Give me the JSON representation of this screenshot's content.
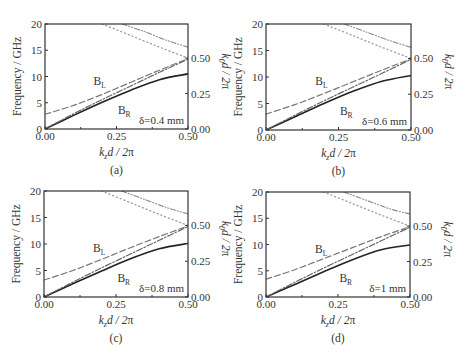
{
  "figure": {
    "common": {
      "xlabel": "k_z d / 2π",
      "ylabel_left": "Frequency / GHz",
      "ylabel_right": "k_0 d / 2π",
      "xticks": [
        "0.00",
        "0.25",
        "0.50"
      ],
      "yticks_left": [
        "0",
        "5",
        "10",
        "15",
        "20"
      ],
      "yticks_right": [
        "0.00",
        "0.25",
        "0.50"
      ],
      "band_labels": {
        "left": "B",
        "left_sub": "L",
        "right": "B",
        "right_sub": "R"
      }
    },
    "panels": [
      {
        "id": "a",
        "caption": "(a)",
        "annotation": "δ=0.4 mm"
      },
      {
        "id": "b",
        "caption": "(b)",
        "annotation": "δ=0.6 mm"
      },
      {
        "id": "c",
        "caption": "(c)",
        "annotation": "δ=0.8 mm"
      },
      {
        "id": "d",
        "caption": "(d)",
        "annotation": "δ=1 mm"
      }
    ]
  },
  "chart_data": [
    {
      "type": "line",
      "title": "(a) δ=0.4 mm",
      "xlabel": "k_z d/2π",
      "ylabel": "Frequency/GHz",
      "ylabel_right": "k_0 d/2π",
      "xlim": [
        0,
        0.5
      ],
      "ylim": [
        0,
        20
      ],
      "ylim_right": [
        0,
        0.74
      ],
      "x": [
        0,
        0.1,
        0.2,
        0.3,
        0.4,
        0.5
      ],
      "series": [
        {
          "name": "B_R (solid)",
          "values": [
            0,
            2.6,
            5.1,
            7.4,
            9.4,
            10.5
          ]
        },
        {
          "name": "dash-dot",
          "values": [
            0,
            2.9,
            5.6,
            8.2,
            10.8,
            13.3
          ]
        },
        {
          "name": "B_L (dashed)",
          "values": [
            2.8,
            4.5,
            6.6,
            8.9,
            11.2,
            13.4
          ]
        },
        {
          "name": "dotted (light line)",
          "x": [
            0.2,
            0.3,
            0.4,
            0.5
          ],
          "values": [
            20,
            17.8,
            15.6,
            13.5
          ]
        },
        {
          "name": "dash-dot-dot (upper)",
          "x": [
            0.27,
            0.35,
            0.43,
            0.5
          ],
          "values": [
            20,
            18.5,
            16.8,
            15.6
          ]
        }
      ]
    },
    {
      "type": "line",
      "title": "(b) δ=0.6 mm",
      "xlabel": "k_z d/2π",
      "ylabel": "Frequency/GHz",
      "ylabel_right": "k_0 d/2π",
      "xlim": [
        0,
        0.5
      ],
      "ylim": [
        0,
        20
      ],
      "ylim_right": [
        0,
        0.74
      ],
      "x": [
        0,
        0.1,
        0.2,
        0.3,
        0.4,
        0.5
      ],
      "series": [
        {
          "name": "B_R (solid)",
          "values": [
            0,
            2.5,
            5.0,
            7.3,
            9.2,
            10.3
          ]
        },
        {
          "name": "dash-dot",
          "values": [
            0,
            2.8,
            5.5,
            8.1,
            10.7,
            13.3
          ]
        },
        {
          "name": "B_L (dashed)",
          "values": [
            3.0,
            4.8,
            6.9,
            9.1,
            11.3,
            13.4
          ]
        },
        {
          "name": "dotted (light line)",
          "x": [
            0.2,
            0.3,
            0.4,
            0.5
          ],
          "values": [
            20,
            17.8,
            15.6,
            13.5
          ]
        },
        {
          "name": "dash-dot-dot (upper)",
          "x": [
            0.27,
            0.35,
            0.43,
            0.5
          ],
          "values": [
            20,
            18.4,
            16.8,
            15.6
          ]
        }
      ]
    },
    {
      "type": "line",
      "title": "(c) δ=0.8 mm",
      "xlabel": "k_z d/2π",
      "ylabel": "Frequency/GHz",
      "ylabel_right": "k_0 d/2π",
      "xlim": [
        0,
        0.5
      ],
      "ylim": [
        0,
        20
      ],
      "ylim_right": [
        0,
        0.74
      ],
      "x": [
        0,
        0.1,
        0.2,
        0.3,
        0.4,
        0.5
      ],
      "series": [
        {
          "name": "B_R (solid)",
          "values": [
            0,
            2.5,
            4.9,
            7.2,
            9.1,
            10.1
          ]
        },
        {
          "name": "dash-dot",
          "values": [
            0,
            2.8,
            5.5,
            8.1,
            10.7,
            13.3
          ]
        },
        {
          "name": "B_L (dashed)",
          "values": [
            3.2,
            5.0,
            7.1,
            9.3,
            11.4,
            13.4
          ]
        },
        {
          "name": "dotted (light line)",
          "x": [
            0.2,
            0.3,
            0.4,
            0.5
          ],
          "values": [
            20,
            17.8,
            15.6,
            13.5
          ]
        },
        {
          "name": "dash-dot-dot (upper)",
          "x": [
            0.27,
            0.35,
            0.43,
            0.5
          ],
          "values": [
            20,
            18.4,
            16.8,
            15.7
          ]
        }
      ]
    },
    {
      "type": "line",
      "title": "(d) δ=1 mm",
      "xlabel": "k_z d/2π",
      "ylabel": "Frequency/GHz",
      "ylabel_right": "k_0 d/2π",
      "xlim": [
        0,
        0.5
      ],
      "ylim": [
        0,
        20
      ],
      "ylim_right": [
        0,
        0.74
      ],
      "x": [
        0,
        0.1,
        0.2,
        0.3,
        0.4,
        0.5
      ],
      "series": [
        {
          "name": "B_R (solid)",
          "values": [
            0,
            2.4,
            4.8,
            7.1,
            9.0,
            9.9
          ]
        },
        {
          "name": "dash-dot",
          "values": [
            0,
            2.8,
            5.5,
            8.1,
            10.7,
            13.3
          ]
        },
        {
          "name": "B_L (dashed)",
          "values": [
            3.4,
            5.2,
            7.3,
            9.4,
            11.5,
            13.4
          ]
        },
        {
          "name": "dotted (light line)",
          "x": [
            0.2,
            0.3,
            0.4,
            0.5
          ],
          "values": [
            20,
            17.8,
            15.6,
            13.5
          ]
        },
        {
          "name": "dash-dot-dot (upper)",
          "x": [
            0.27,
            0.35,
            0.43,
            0.5
          ],
          "values": [
            20,
            18.4,
            16.8,
            15.8
          ]
        }
      ]
    }
  ]
}
